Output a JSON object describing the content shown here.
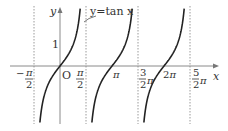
{
  "chart_data": {
    "type": "line",
    "title": "",
    "function_label": "y=tan x",
    "xlabel": "x",
    "ylabel": "y",
    "origin_label": "O",
    "y_tick_labels": [
      "1"
    ],
    "x_tick_labels": [
      "-π/2",
      "π/2",
      "π",
      "3/2π",
      "2π",
      "5/2π"
    ],
    "asymptotes": [
      "-π/2",
      "π/2",
      "3π/2",
      "5π/2"
    ],
    "x_range": [
      -1.9,
      6.3
    ],
    "y_range": [
      -2.7,
      2.8
    ],
    "series": [
      {
        "name": "tan x branch 1",
        "domain": [
          "-π/2",
          "π/2"
        ]
      },
      {
        "name": "tan x branch 2",
        "domain": [
          "π/2",
          "3π/2"
        ]
      },
      {
        "name": "tan x branch 3",
        "domain": [
          "3π/2",
          "5π/2"
        ]
      }
    ],
    "colors": {
      "curve": "#222222",
      "axis": "#888888",
      "asymptote": "#999999"
    }
  }
}
